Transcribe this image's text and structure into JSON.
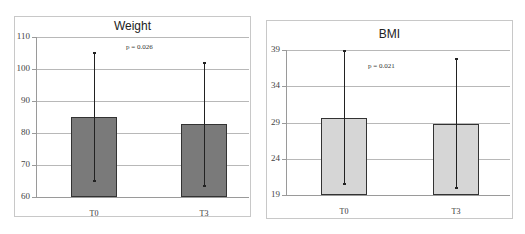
{
  "chart_data": [
    {
      "type": "bar",
      "title": "Weight",
      "categories": [
        "T0",
        "T3"
      ],
      "values": [
        85,
        82.7
      ],
      "error_bars": [
        {
          "low": 65,
          "high": 105
        },
        {
          "low": 63.3,
          "high": 102
        }
      ],
      "annotation": "p = 0.026",
      "ylim": [
        60,
        110
      ],
      "yticks": [
        60,
        70,
        80,
        90,
        100,
        110
      ],
      "bar_color": "#7a7a7a",
      "grid": true,
      "xlabel": "",
      "ylabel": ""
    },
    {
      "type": "bar",
      "title": "BMI",
      "categories": [
        "T0",
        "T3"
      ],
      "values": [
        29.6,
        28.8
      ],
      "error_bars": [
        {
          "low": 20.5,
          "high": 38.8
        },
        {
          "low": 19.9,
          "high": 37.8
        }
      ],
      "annotation": "p = 0.021",
      "ylim": [
        19,
        39
      ],
      "yticks": [
        19,
        24,
        29,
        34,
        39
      ],
      "bar_color": "#d6d6d6",
      "grid": true,
      "xlabel": "",
      "ylabel": ""
    }
  ]
}
